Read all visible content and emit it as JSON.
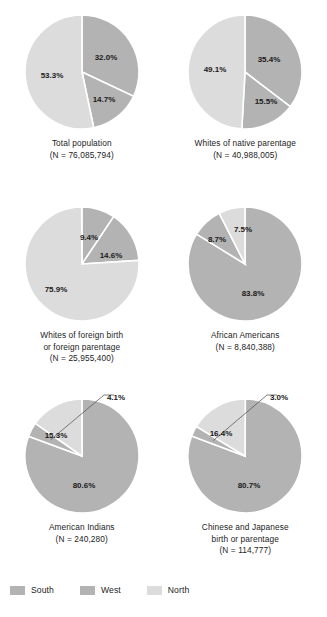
{
  "figure": {
    "title": "",
    "background": "#ffffff"
  },
  "colors": {
    "south": "#b3b3b3",
    "west": "#b3b3b3",
    "north": "#dcdcdc",
    "slice_border": "#ffffff",
    "text": "#1a1a1a",
    "leader_line": "#5a5a5a"
  },
  "legend": {
    "position": "bottom-left",
    "items": [
      {
        "label": "South",
        "color": "#b3b3b3",
        "swatch": "legend-swatch-south"
      },
      {
        "label": "West",
        "color": "#b3b3b3",
        "swatch": "legend-swatch-west"
      },
      {
        "label": "North",
        "color": "#dcdcdc",
        "swatch": "legend-swatch-north"
      }
    ]
  },
  "chart_data": {
    "type": "pie",
    "title": "",
    "subtitle": "",
    "categories": [
      "South",
      "West",
      "North"
    ],
    "series_colors": [
      "#b3b3b3",
      "#b3b3b3",
      "#dcdcdc"
    ],
    "panels": [
      {
        "name": "total-population",
        "caption_lines": [
          "Total population",
          "(N = 76,085,794)"
        ],
        "n": 76085794,
        "values": [
          32.0,
          14.7,
          53.3
        ],
        "labels": [
          "32.0%",
          "14.7%",
          "53.3%"
        ],
        "label_positions": [
          {
            "x": 24,
            "y": -14,
            "leader": false
          },
          {
            "x": 22,
            "y": 28,
            "leader": false
          },
          {
            "x": -30,
            "y": 4,
            "leader": false
          }
        ]
      },
      {
        "name": "whites-of-native-parentage",
        "caption_lines": [
          "Whites of native parentage",
          "(N = 40,988,005)"
        ],
        "n": 40988005,
        "values": [
          35.4,
          15.5,
          49.1
        ],
        "labels": [
          "35.4%",
          "15.5%",
          "49.1%"
        ],
        "label_positions": [
          {
            "x": 24,
            "y": -12,
            "leader": false
          },
          {
            "x": 21,
            "y": 30,
            "leader": false
          },
          {
            "x": -30,
            "y": -2,
            "leader": false
          }
        ]
      },
      {
        "name": "whites-of-foreign-birth-or-foreign-parentage",
        "caption_lines": [
          "Whites of foreign birth",
          "or foreign parentage",
          "(N = 25,955,400)"
        ],
        "n": 25955400,
        "values": [
          9.4,
          14.6,
          75.9
        ],
        "labels": [
          "9.4%",
          "14.6%",
          "75.9%"
        ],
        "label_positions": [
          {
            "x": 7,
            "y": -26,
            "leader": false
          },
          {
            "x": 29,
            "y": -8,
            "leader": false
          },
          {
            "x": -26,
            "y": 26,
            "leader": false
          }
        ]
      },
      {
        "name": "african-americans",
        "caption_lines": [
          "African Americans",
          "(N = 8,840,388)"
        ],
        "n": 8840388,
        "values": [
          83.8,
          8.7,
          7.5
        ],
        "labels": [
          "83.8%",
          "8.7%",
          "7.5%"
        ],
        "label_positions": [
          {
            "x": 8,
            "y": 30,
            "leader": false
          },
          {
            "x": -28,
            "y": -24,
            "leader": false
          },
          {
            "x": -2,
            "y": -34,
            "leader": false
          }
        ]
      },
      {
        "name": "american-indians",
        "caption_lines": [
          "American Indians",
          "(N = 240,280)"
        ],
        "n": 240280,
        "values": [
          80.6,
          4.1,
          15.3
        ],
        "labels": [
          "80.6%",
          "4.1%",
          "15.3%"
        ],
        "label_positions": [
          {
            "x": 2,
            "y": 30,
            "leader": false
          },
          {
            "x": 34,
            "y": -58,
            "leader": true
          },
          {
            "x": -26,
            "y": -20,
            "leader": false
          }
        ]
      },
      {
        "name": "chinese-and-japanese-birth-or-parentage",
        "caption_lines": [
          "Chinese and Japanese",
          "birth or parentage",
          "(N = 114,777)"
        ],
        "n": 114777,
        "values": [
          80.7,
          3.0,
          16.4
        ],
        "labels": [
          "80.7%",
          "3.0%",
          "16.4%"
        ],
        "label_positions": [
          {
            "x": 4,
            "y": 30,
            "leader": false
          },
          {
            "x": 34,
            "y": -58,
            "leader": true
          },
          {
            "x": -24,
            "y": -22,
            "leader": false
          }
        ]
      }
    ]
  }
}
